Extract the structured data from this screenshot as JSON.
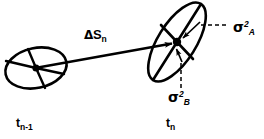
{
  "figure": {
    "background_color": "#ffffff",
    "stroke_color": "#000000",
    "width": 264,
    "height": 139
  },
  "labels": {
    "displacement": {
      "delta": "Δ",
      "symbol": "S",
      "subscript": "n",
      "full": "ΔSₙ"
    },
    "sigma_a": {
      "symbol": "σ",
      "superscript": "2",
      "subscript": "A",
      "full": "σ²A"
    },
    "sigma_b": {
      "symbol": "σ",
      "superscript": "2",
      "subscript": "B",
      "full": "σ²B"
    },
    "time_previous": {
      "symbol": "t",
      "subscript": "n-1",
      "full": "tₙ₋₁"
    },
    "time_current": {
      "symbol": "t",
      "subscript": "n",
      "full": "tₙ"
    }
  },
  "shapes": {
    "ellipse_previous": {
      "name": "error-ellipse-previous",
      "center_x": 36,
      "center_y": 68,
      "radius_x": 31,
      "radius_y": 20,
      "rotation_deg": -12,
      "spokes": 4
    },
    "ellipse_current": {
      "name": "error-ellipse-current",
      "center_x": 177,
      "center_y": 42,
      "radius_x": 45,
      "radius_y": 19,
      "rotation_deg": -58,
      "axes": 2
    },
    "displacement_vector": {
      "name": "displacement-arrow",
      "x1": 38,
      "y1": 68,
      "x2": 173,
      "y2": 44
    },
    "leader_sigma_a": {
      "name": "leader-line-sigma-a",
      "x1": 223,
      "y1": 25,
      "x2": 196,
      "y2": 25,
      "style": "dashed"
    },
    "leader_sigma_b": {
      "name": "leader-line-sigma-b",
      "x1": 181,
      "y1": 62,
      "x2": 181,
      "y2": 88,
      "style": "dashed"
    },
    "arrow_sigma_a": {
      "name": "sigma-a-arrow",
      "x1": 199,
      "y1": 22,
      "x2": 180,
      "y2": 40
    },
    "arrow_sigma_b": {
      "name": "sigma-b-arrow",
      "x1": 182,
      "y1": 60,
      "x2": 176,
      "y2": 47
    }
  }
}
